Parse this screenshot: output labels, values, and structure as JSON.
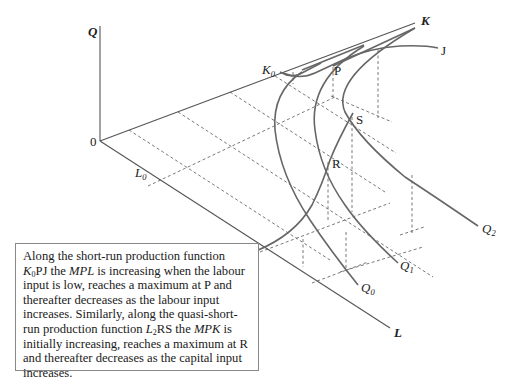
{
  "diagram": {
    "axes": {
      "q_axis_label": "Q",
      "k_axis_label": "K",
      "l_axis_label": "L",
      "origin_label": "0"
    },
    "points": {
      "k0": {
        "main": "K",
        "sub": "0"
      },
      "l0": {
        "main": "L",
        "sub": "0"
      },
      "l2": {
        "main": "L",
        "sub": "2"
      },
      "p": "P",
      "j": "J",
      "s": "S",
      "r": "R"
    },
    "isoquants": [
      {
        "main": "Q",
        "sub": "0"
      },
      {
        "main": "Q",
        "sub": "1"
      },
      {
        "main": "Q",
        "sub": "2"
      }
    ],
    "colors": {
      "curve": "#666666",
      "axis": "#555555",
      "dashed_projection": "#555555",
      "caption_border": "#888888"
    }
  },
  "caption": {
    "line1_pre": "Along the short-run production function",
    "line2_k": "K",
    "line2_k_sub": "0",
    "line2_after_k": "PJ the ",
    "mpl": "MPL",
    "line2_rest": " is increasing when the labour input is low, reaches a maximum at P and thereafter decreases as the labour input increases. Similarly, along the quasi-short-run production function ",
    "l": "L",
    "l_sub": "2",
    "after_l": "RS the ",
    "mpk": "MPK",
    "final": " is initially increasing, reaches a maximum at R and thereafter decreases as the capital input increases."
  }
}
